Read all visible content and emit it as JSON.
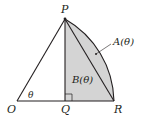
{
  "diagram": {
    "points": {
      "O": {
        "label": "O",
        "x": 17,
        "y": 101
      },
      "Q": {
        "label": "Q",
        "x": 65,
        "y": 101
      },
      "R": {
        "label": "R",
        "x": 114,
        "y": 101
      },
      "P": {
        "label": "P",
        "x": 65,
        "y": 19
      }
    },
    "angle_label": "θ",
    "region_A_label": "A(θ)",
    "region_B_label": "B(θ)",
    "colors": {
      "stroke": "#231f20",
      "shade": "#d4d4d4",
      "background": "#ffffff"
    }
  }
}
